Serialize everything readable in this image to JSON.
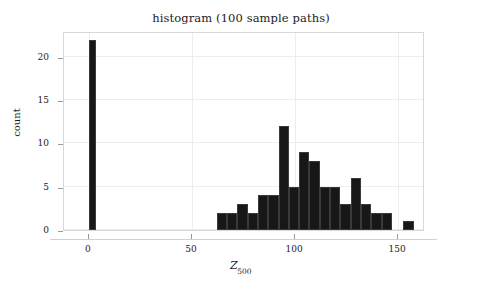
{
  "chart_data": {
    "type": "bar",
    "title": "histogram (100 sample paths)",
    "xlabel": "Z_500",
    "xlabel_base": "Z",
    "xlabel_sub": "500",
    "ylabel": "count",
    "xlim": [
      -12,
      163
    ],
    "ylim": [
      0,
      23
    ],
    "xticks": [
      0,
      50,
      100,
      150
    ],
    "xtick_labels": [
      "0",
      "50",
      "100",
      "150"
    ],
    "yticks": [
      0,
      5,
      10,
      15,
      20
    ],
    "ytick_labels": [
      "0",
      "5",
      "10",
      "15",
      "20"
    ],
    "grid": true,
    "grid_color": "#ededed",
    "bar_color": "#171717",
    "frame_color": "#d8d8d8",
    "legend": null,
    "bin_width": 5.6,
    "bars": [
      {
        "left": 0.0,
        "right": 3.6,
        "value": 22
      },
      {
        "left": 62.0,
        "right": 67.0,
        "value": 2
      },
      {
        "left": 67.0,
        "right": 72.0,
        "value": 2
      },
      {
        "left": 72.0,
        "right": 77.0,
        "value": 3
      },
      {
        "left": 77.0,
        "right": 82.0,
        "value": 2
      },
      {
        "left": 82.0,
        "right": 87.0,
        "value": 4
      },
      {
        "left": 87.0,
        "right": 92.0,
        "value": 4
      },
      {
        "left": 92.0,
        "right": 97.0,
        "value": 12
      },
      {
        "left": 97.0,
        "right": 102.0,
        "value": 5
      },
      {
        "left": 102.0,
        "right": 107.0,
        "value": 9
      },
      {
        "left": 107.0,
        "right": 112.0,
        "value": 8
      },
      {
        "left": 112.0,
        "right": 117.0,
        "value": 5
      },
      {
        "left": 117.0,
        "right": 122.0,
        "value": 5
      },
      {
        "left": 122.0,
        "right": 127.0,
        "value": 3
      },
      {
        "left": 127.0,
        "right": 132.0,
        "value": 6
      },
      {
        "left": 132.0,
        "right": 137.0,
        "value": 3
      },
      {
        "left": 137.0,
        "right": 142.0,
        "value": 2
      },
      {
        "left": 142.0,
        "right": 147.0,
        "value": 2
      },
      {
        "left": 152.5,
        "right": 157.5,
        "value": 1
      }
    ]
  }
}
